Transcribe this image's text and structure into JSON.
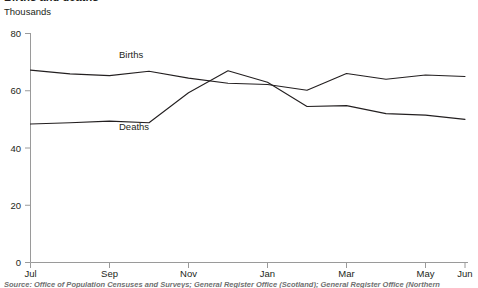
{
  "title": "Births and deaths",
  "unit_label": "Thousands",
  "source_note": "Source: Office of Population Censuses and Surveys; General Register Office (Scotland); General Register Office (Northern",
  "colors": {
    "line": "#231f20",
    "axis": "#9a9a9a",
    "text": "#231f20",
    "source_text": "#6f6f6f",
    "background": "#ffffff"
  },
  "chart_data": {
    "type": "line",
    "title": "Births and deaths",
    "xlabel": "",
    "ylabel": "Thousands",
    "ylim": [
      0,
      80
    ],
    "yticks": [
      0,
      20,
      40,
      60,
      80
    ],
    "ytick_labels": [
      "0",
      "20",
      "40",
      "60",
      "80"
    ],
    "grid": false,
    "legend": "inline-labels",
    "x": [
      "Jul",
      "Aug",
      "Sep",
      "Oct",
      "Nov",
      "Dec",
      "Jan",
      "Feb",
      "Mar",
      "Apr",
      "May",
      "Jun"
    ],
    "xticks": [
      "Jul",
      "Sep",
      "Nov",
      "Jan",
      "Mar",
      "May",
      "Jun"
    ],
    "series": [
      {
        "name": "Births",
        "values": [
          67.2,
          65.9,
          65.3,
          66.8,
          64.4,
          62.6,
          62.2,
          60.2,
          66.0,
          64.0,
          65.5,
          65.0
        ]
      },
      {
        "name": "Deaths",
        "values": [
          48.4,
          48.8,
          49.4,
          48.8,
          59.3,
          67.0,
          63.0,
          54.5,
          54.8,
          52.0,
          51.5,
          50.0
        ]
      }
    ],
    "annotations": [
      {
        "text": "Births",
        "x": "Oct",
        "y": 74.5
      },
      {
        "text": "Deaths",
        "x": "Nov",
        "y": 45.5
      }
    ]
  }
}
